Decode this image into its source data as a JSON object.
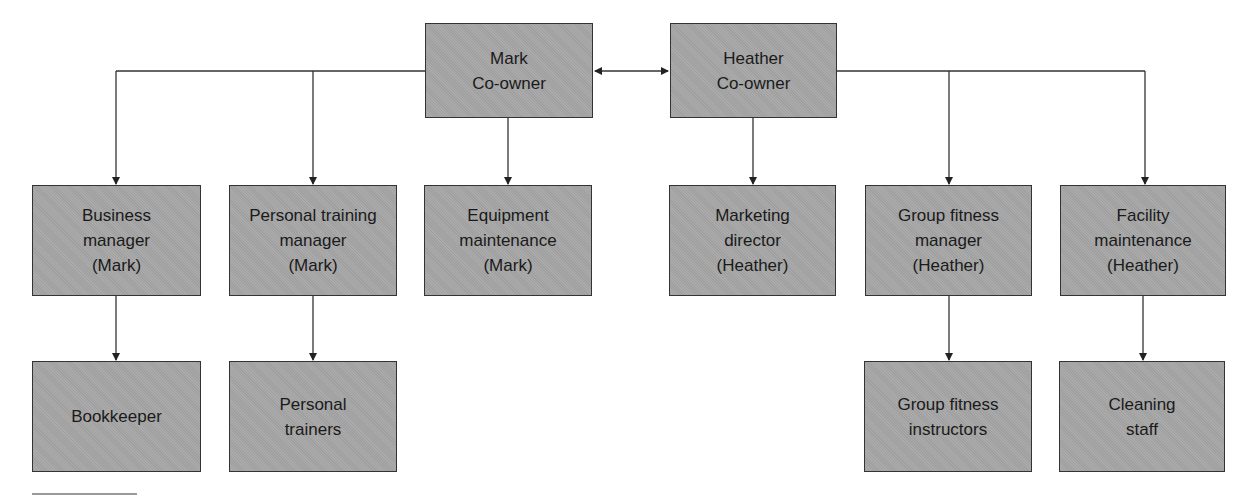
{
  "diagram": {
    "type": "org-chart",
    "owners": [
      {
        "id": "mark",
        "label": "Mark\nCo-owner"
      },
      {
        "id": "heather",
        "label": "Heather\nCo-owner"
      }
    ],
    "managers": [
      {
        "id": "business",
        "label": "Business\nmanager\n(Mark)",
        "reports_to": "mark"
      },
      {
        "id": "pt_manager",
        "label": "Personal training\nmanager\n(Mark)",
        "reports_to": "mark"
      },
      {
        "id": "equipment",
        "label": "Equipment\nmaintenance\n(Mark)",
        "reports_to": "mark"
      },
      {
        "id": "marketing",
        "label": "Marketing\ndirector\n(Heather)",
        "reports_to": "heather"
      },
      {
        "id": "group_fitness",
        "label": "Group fitness\nmanager\n(Heather)",
        "reports_to": "heather"
      },
      {
        "id": "facility",
        "label": "Facility\nmaintenance\n(Heather)",
        "reports_to": "heather"
      }
    ],
    "staff": [
      {
        "id": "bookkeeper",
        "label": "Bookkeeper",
        "reports_to": "business"
      },
      {
        "id": "trainers",
        "label": "Personal\ntrainers",
        "reports_to": "pt_manager"
      },
      {
        "id": "instructors",
        "label": "Group fitness\ninstructors",
        "reports_to": "group_fitness"
      },
      {
        "id": "cleaning",
        "label": "Cleaning\nstaff",
        "reports_to": "facility"
      }
    ],
    "owner_relation": "bidirectional",
    "colors": {
      "box_fill": "#a6a6a6",
      "border": "#333333",
      "line": "#333333",
      "text": "#1a1a1a"
    }
  }
}
